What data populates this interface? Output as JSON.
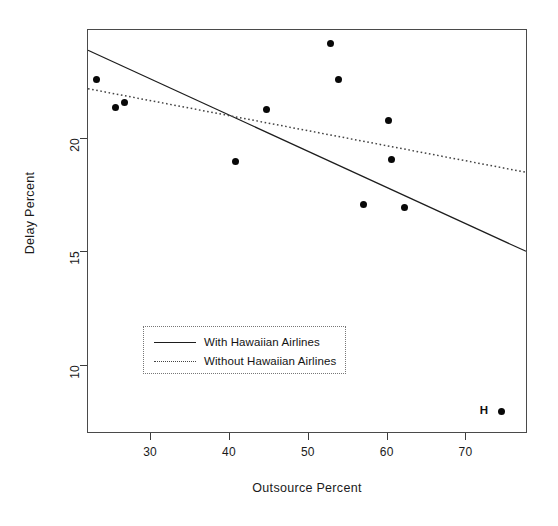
{
  "chart_data": {
    "type": "scatter",
    "title": "",
    "subtitle": "",
    "xlabel": "Outsource Percent",
    "ylabel": "Delay Percent",
    "xlim": [
      22.0,
      77.8
    ],
    "ylim": [
      7.0,
      24.8
    ],
    "xticks": [
      30,
      40,
      50,
      60,
      70
    ],
    "yticks": [
      10,
      15,
      20
    ],
    "xtick_labels": [
      "30",
      "40",
      "50",
      "60",
      "70"
    ],
    "ytick_labels": [
      "10",
      "15",
      "20"
    ],
    "grid": false,
    "legend_position": "lower-left-inside",
    "points": [
      {
        "x": 23.1,
        "y": 22.6,
        "label": ""
      },
      {
        "x": 25.5,
        "y": 21.4,
        "label": ""
      },
      {
        "x": 26.6,
        "y": 21.6,
        "label": ""
      },
      {
        "x": 40.7,
        "y": 19.0,
        "label": ""
      },
      {
        "x": 44.7,
        "y": 21.3,
        "label": ""
      },
      {
        "x": 52.8,
        "y": 24.2,
        "label": ""
      },
      {
        "x": 53.8,
        "y": 22.6,
        "label": ""
      },
      {
        "x": 57.0,
        "y": 17.1,
        "label": ""
      },
      {
        "x": 60.1,
        "y": 20.8,
        "label": ""
      },
      {
        "x": 60.5,
        "y": 19.1,
        "label": ""
      },
      {
        "x": 62.1,
        "y": 17.0,
        "label": ""
      },
      {
        "x": 74.4,
        "y": 8.0,
        "label": "H"
      }
    ],
    "annotations": [
      {
        "text": "H",
        "x": 72.2,
        "y": 8.05
      }
    ],
    "series": [
      {
        "name": "With Hawaiian Airlines",
        "type": "line",
        "style": "solid",
        "color": "#1d1d1d",
        "endpoints": [
          {
            "x": 22.0,
            "y": 23.9
          },
          {
            "x": 77.8,
            "y": 15.0
          }
        ]
      },
      {
        "name": "Without Hawaiian Airlines",
        "type": "line",
        "style": "dotted",
        "color": "#444444",
        "endpoints": [
          {
            "x": 22.0,
            "y": 22.2
          },
          {
            "x": 77.8,
            "y": 18.5
          }
        ]
      }
    ]
  },
  "axes": {
    "x_label": "Outsource Percent",
    "y_label": "Delay Percent",
    "x_ticks": [
      "30",
      "40",
      "50",
      "60",
      "70"
    ],
    "y_ticks": [
      "10",
      "15",
      "20"
    ]
  },
  "legend": {
    "entries": [
      {
        "label": "With Hawaiian Airlines",
        "key": "solid-line-key"
      },
      {
        "label": "Without Hawaiian Airlines",
        "key": "dotted-line-key"
      }
    ]
  }
}
